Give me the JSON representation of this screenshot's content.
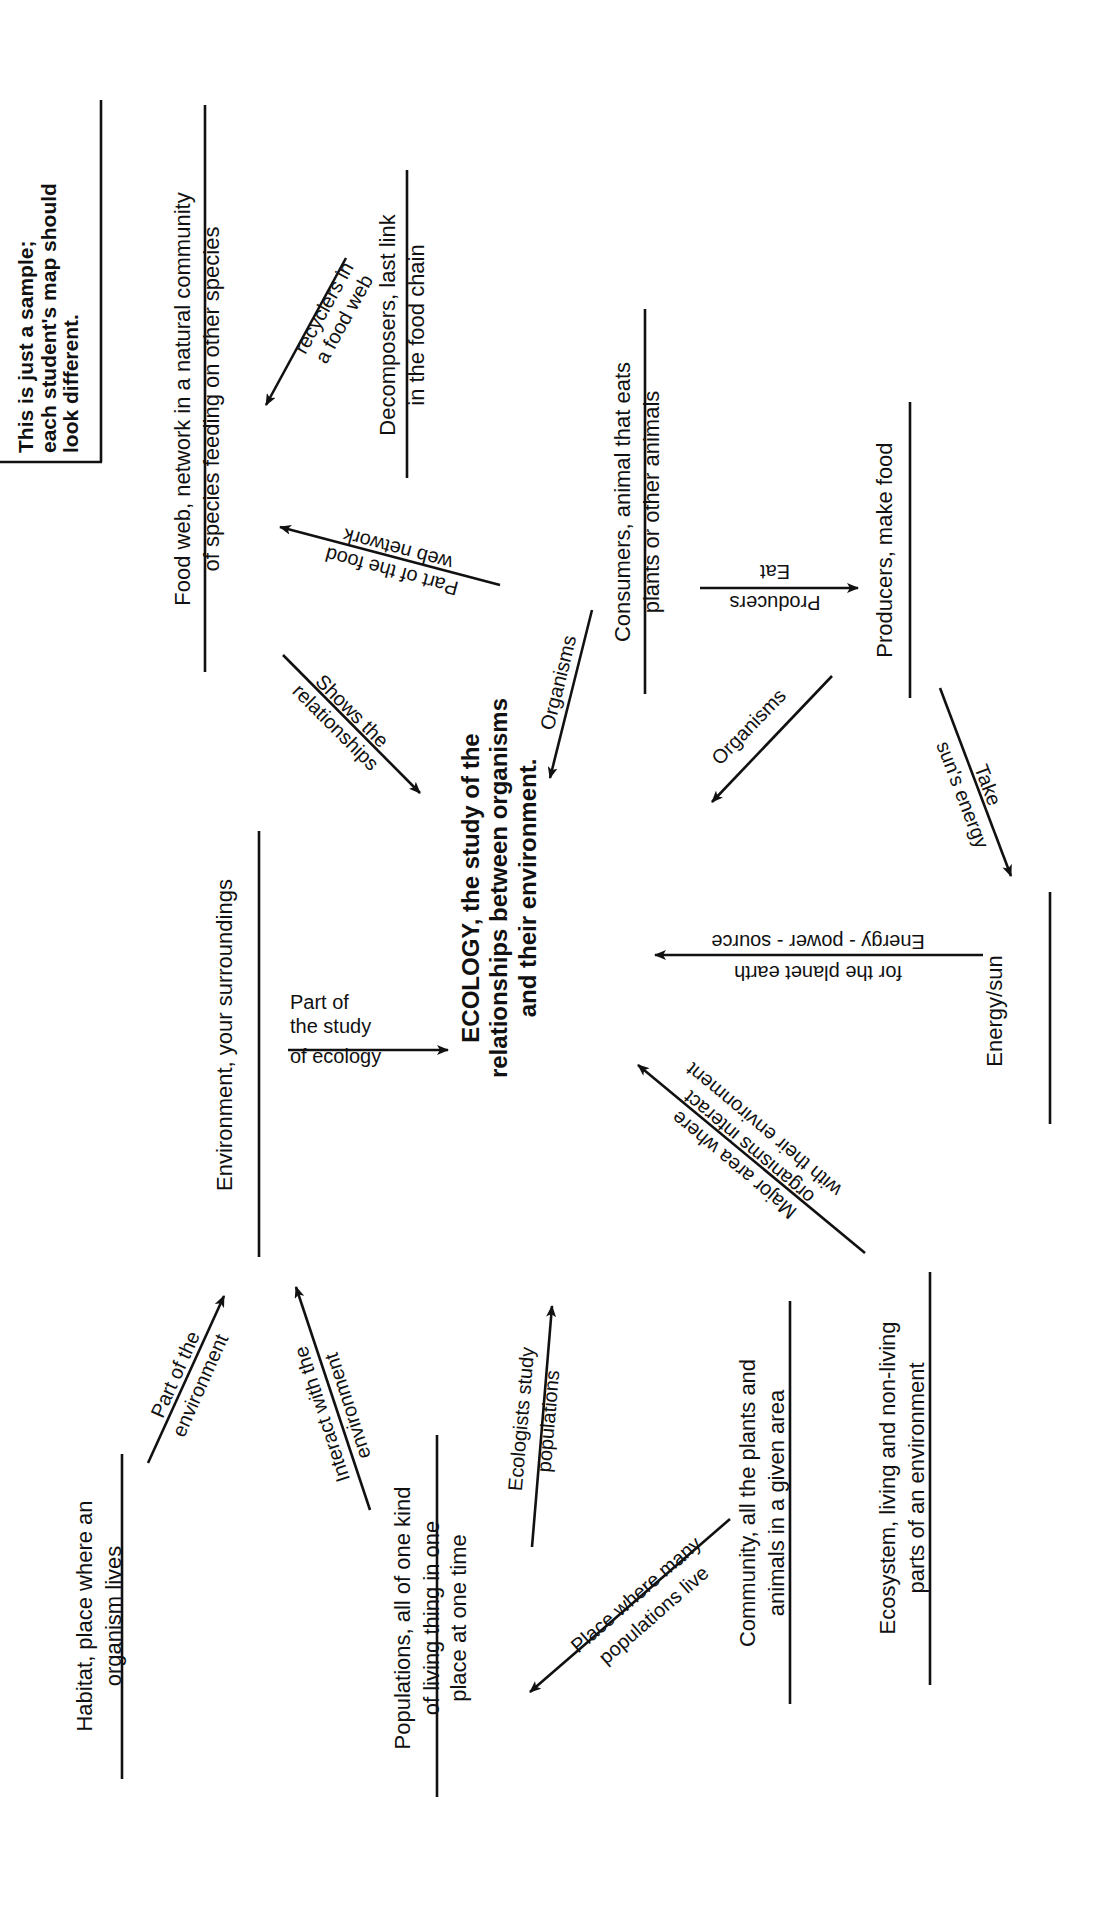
{
  "note": {
    "lines": [
      "This is just a sample;",
      "each student's map should",
      "look different."
    ]
  },
  "center": {
    "lines": [
      "ECOLOGY, the study of the",
      "relationships between organisms",
      "and their environment."
    ]
  },
  "nodes": {
    "food_web": {
      "line1": "Food web, network in a natural community",
      "line2": "of species feeding on other species"
    },
    "decomposers": {
      "line1": "Decomposers, last link",
      "line2": "in the food chain"
    },
    "consumers": {
      "line1": "Consumers, animal that eats",
      "line2": "plants or other animals"
    },
    "producers": {
      "line1": "Producers, make food",
      "line2": ""
    },
    "energy_sun": {
      "line1": "Energy/sun",
      "line2": ""
    },
    "environment": {
      "line1": "Environment, your surroundings",
      "line2": ""
    },
    "habitat": {
      "line1": "Habitat, place where an",
      "line2": "organism lives"
    },
    "populations": {
      "line1": "Populations, all of one kind",
      "line2": "of living thing in one",
      "line3": "place at one time"
    },
    "community": {
      "line1": "Community, all the plants and",
      "line2": "animals in a given area"
    },
    "ecosystem": {
      "line1": "Ecosystem, living and non-living",
      "line2": "parts of an environment"
    }
  },
  "links": {
    "recyclers": {
      "line1": "recyclers in",
      "line2": "a food web"
    },
    "part_of_food_web": {
      "line1": "Part of the food",
      "line2": "web network"
    },
    "shows_relationships": {
      "line1": "Shows the",
      "line2": "relationships"
    },
    "organisms_1": {
      "line1": "Organisms"
    },
    "organisms_2": {
      "line1": "Organisms"
    },
    "eat_producers": {
      "line1": "Producers",
      "line2": "Eat"
    },
    "take_suns_energy": {
      "line1": "Take",
      "line2": "sun's energy"
    },
    "energy_power_source": {
      "line1": "for the planet earth",
      "line2": "Energy - power - source"
    },
    "major_area": {
      "line1": "Major area where",
      "line2": "organisms interact",
      "line3": "with their environment"
    },
    "part_of_study": {
      "line1": "Part of",
      "line2": "the study",
      "line3": "of ecology"
    },
    "part_of_environment": {
      "line1": "Part of the",
      "line2": "environment"
    },
    "interact_environment": {
      "line1": "Interact with the",
      "line2": "environment"
    },
    "ecologists_study": {
      "line1": "Ecologists study",
      "line2": "populations"
    },
    "place_many_populations": {
      "line1": "Place where many",
      "line2": "populations live"
    }
  },
  "colors": {
    "ink": "#111111",
    "paper": "#ffffff"
  },
  "orientation": "page rotated 90° counter-clockwise"
}
